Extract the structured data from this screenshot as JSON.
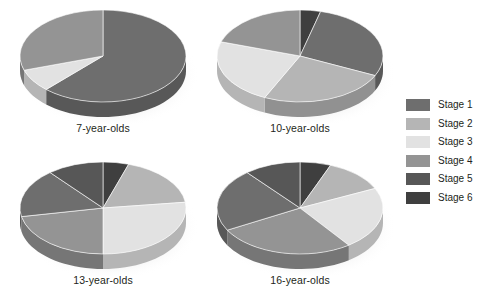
{
  "figure": {
    "background": "#ffffff",
    "layout": "2x2 grid of 3D pie charts with legend at right"
  },
  "legend": {
    "position": "right",
    "items": [
      {
        "label": "Stage 1",
        "color": "#6e6e6e"
      },
      {
        "label": "Stage 2",
        "color": "#b5b5b5"
      },
      {
        "label": "Stage 3",
        "color": "#e2e2e2"
      },
      {
        "label": "Stage 4",
        "color": "#949494"
      },
      {
        "label": "Stage 5",
        "color": "#575757"
      },
      {
        "label": "Stage 6",
        "color": "#3f3f3f"
      }
    ]
  },
  "chart_data": [
    {
      "type": "pie",
      "title": "7-year-olds",
      "labels": [
        "Stage 6",
        "Stage 1",
        "Stage 2",
        "Stage 3",
        "Stage 4",
        "Stage 5"
      ],
      "values": [
        0,
        62,
        0,
        8,
        30,
        0
      ],
      "colors": [
        "#3f3f3f",
        "#6e6e6e",
        "#b5b5b5",
        "#e2e2e2",
        "#949494",
        "#575757"
      ],
      "units": "percent",
      "three_d": true
    },
    {
      "type": "pie",
      "title": "10-year-olds",
      "labels": [
        "Stage 6",
        "Stage 1",
        "Stage 2",
        "Stage 3",
        "Stage 4",
        "Stage 5"
      ],
      "values": [
        4,
        28,
        25,
        23,
        20,
        0
      ],
      "colors": [
        "#3f3f3f",
        "#6e6e6e",
        "#b5b5b5",
        "#e2e2e2",
        "#949494",
        "#575757"
      ],
      "units": "percent",
      "three_d": true
    },
    {
      "type": "pie",
      "title": "13-year-olds",
      "labels": [
        "Stage 6",
        "Stage 2",
        "Stage 3",
        "Stage 4",
        "Stage 1",
        "Stage 5"
      ],
      "values": [
        5,
        18,
        27,
        22,
        17,
        11
      ],
      "colors": [
        "#3f3f3f",
        "#b5b5b5",
        "#e2e2e2",
        "#949494",
        "#6e6e6e",
        "#575757"
      ],
      "units": "percent",
      "three_d": true
    },
    {
      "type": "pie",
      "title": "16-year-olds",
      "labels": [
        "Stage 6",
        "Stage 2",
        "Stage 3",
        "Stage 4",
        "Stage 1",
        "Stage 5"
      ],
      "values": [
        6,
        12,
        22,
        27,
        22,
        11
      ],
      "colors": [
        "#3f3f3f",
        "#b5b5b5",
        "#e2e2e2",
        "#949494",
        "#6e6e6e",
        "#575757"
      ],
      "units": "percent",
      "three_d": true
    }
  ]
}
